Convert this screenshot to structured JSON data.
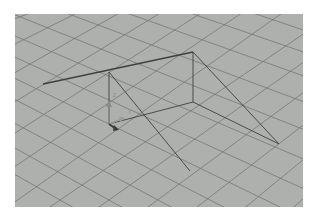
{
  "viewport": {
    "name": "3D perspective viewport",
    "background": "#aeb0ae",
    "grid_color": "#6f716f",
    "wire_color": "#3e403e"
  },
  "gizmo": {
    "axes": [
      {
        "axis": "Z",
        "label": "Z",
        "color": "#8c8c8c"
      },
      {
        "axis": "Y",
        "label": "Y",
        "color": "#9a9a9a"
      },
      {
        "axis": "X",
        "label": "X",
        "color": "#444444"
      }
    ]
  },
  "scene": {
    "object": "wireframe camera/light frustum shape"
  }
}
